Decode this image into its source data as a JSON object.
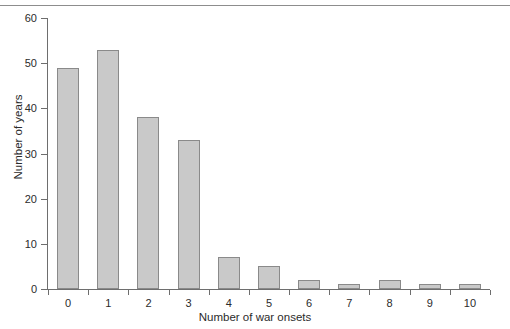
{
  "chart_data": {
    "type": "bar",
    "title": "",
    "subtitle": "",
    "xlabel": "Number of war onsets",
    "ylabel": "Number of years",
    "categories": [
      "0",
      "1",
      "2",
      "3",
      "4",
      "5",
      "6",
      "7",
      "8",
      "9",
      "10"
    ],
    "values": [
      49,
      53,
      38,
      33,
      7,
      5,
      2,
      1,
      2,
      1,
      1
    ],
    "xlim": [
      -0.5,
      10.5
    ],
    "ylim": [
      0,
      60
    ],
    "yticks": [
      0,
      10,
      20,
      30,
      40,
      50,
      60
    ],
    "ytick_labels": [
      "0",
      "10",
      "20",
      "30",
      "40",
      "50",
      "60"
    ],
    "xtick_labels": [
      "0",
      "1",
      "2",
      "3",
      "4",
      "5",
      "6",
      "7",
      "8",
      "9",
      "10"
    ],
    "grid": false,
    "legend": null,
    "legend_position": "none",
    "annotations": [],
    "bar_fill_color": "#c9c9c9",
    "bar_edge_color": "#8a8a8a",
    "axis_color": "#6e6e6e",
    "background_color": "#ffffff"
  },
  "figure": {
    "top_rule_visible": true
  }
}
